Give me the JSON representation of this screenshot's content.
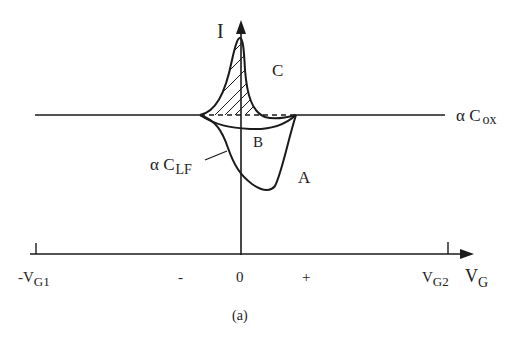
{
  "figure": {
    "caption": "(a)",
    "y_axis_label": "I",
    "x_axis_label": "V",
    "x_axis_label_sub": "G",
    "curve_labels": {
      "A": "A",
      "B": "B",
      "C": "C"
    },
    "cox_label": "α C",
    "cox_label_sub": "ox",
    "clf_label": "α C",
    "clf_label_sub": "LF",
    "ticks": {
      "left": "-V",
      "left_sub": "G1",
      "minus": "-",
      "zero": "0",
      "plus": "+",
      "right": "V",
      "right_sub": "G2"
    },
    "colors": {
      "line": "#1a1a1a",
      "background": "#ffffff"
    }
  }
}
